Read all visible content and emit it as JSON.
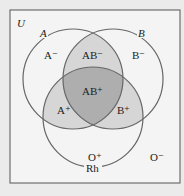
{
  "diagram": {
    "universe_label": "U",
    "sets": [
      {
        "name": "A",
        "label": "A"
      },
      {
        "name": "B",
        "label": "B"
      },
      {
        "name": "Rh",
        "label": "Rh"
      }
    ],
    "regions": {
      "a_neg": "A⁻",
      "ab_neg": "AB⁻",
      "b_neg": "B⁻",
      "a_pos": "A⁺",
      "ab_pos": "AB⁺",
      "b_pos": "B⁺",
      "o_pos": "O⁺",
      "o_neg": "O⁻"
    },
    "colors": {
      "background": "#ebebeb",
      "frame_fill": "#f4f4f4",
      "frame_stroke": "#555555",
      "circle_stroke": "#666666",
      "pair_overlap": "#d6d6d6",
      "triple_overlap": "#aeaeae"
    }
  }
}
